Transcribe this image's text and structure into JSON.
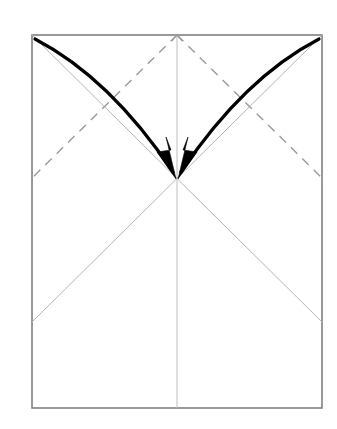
{
  "figure": {
    "type": "origami-instruction",
    "background_color": "#ffffff",
    "canvas": {
      "width": 337,
      "height": 429
    }
  },
  "paper": {
    "name": "paper-sheet",
    "shape": "rectangle",
    "left": 32,
    "top": 35,
    "right": 322,
    "bottom": 408,
    "width": 290,
    "height": 373,
    "fill_color": "#ffffff",
    "edge_color": "#808080",
    "edge_width": 1.6
  },
  "geometry": {
    "center_point": {
      "x": 177,
      "y": 178,
      "label": "convergence-point"
    },
    "top_center": {
      "x": 177,
      "y": 35
    },
    "bottom_center": {
      "x": 177,
      "y": 408
    },
    "top_left": {
      "x": 32,
      "y": 35
    },
    "top_right": {
      "x": 322,
      "y": 35
    },
    "bottom_left": {
      "x": 32,
      "y": 408
    },
    "bottom_right": {
      "x": 322,
      "y": 408
    },
    "left_mid": {
      "x": 32,
      "y": 178
    },
    "right_mid": {
      "x": 322,
      "y": 178
    },
    "left_lower": {
      "x": 32,
      "y": 322
    },
    "right_lower": {
      "x": 322,
      "y": 322
    }
  },
  "crease_lines": {
    "vertical_center": {
      "name": "vertical-center-crease",
      "style": "solid",
      "color": "#bdbdbd",
      "width": 1.0,
      "from": {
        "x": 177,
        "y": 35
      },
      "to": {
        "x": 177,
        "y": 408
      }
    },
    "diagonals": [
      {
        "name": "crease-top-left-to-right-lower",
        "style": "solid",
        "color": "#b5b5b5",
        "width": 1.0,
        "from": {
          "x": 32,
          "y": 35
        },
        "to": {
          "x": 322,
          "y": 322
        }
      },
      {
        "name": "crease-top-right-to-left-lower",
        "style": "solid",
        "color": "#b5b5b5",
        "width": 1.0,
        "from": {
          "x": 322,
          "y": 35
        },
        "to": {
          "x": 32,
          "y": 322
        }
      }
    ],
    "dashed": [
      {
        "name": "valley-fold-left",
        "style": "dashed",
        "color": "#9a9a9a",
        "width": 1.4,
        "dash_pattern": "9 7",
        "from": {
          "x": 177,
          "y": 35
        },
        "to": {
          "x": 32,
          "y": 178
        }
      },
      {
        "name": "valley-fold-right",
        "style": "dashed",
        "color": "#9a9a9a",
        "width": 1.4,
        "dash_pattern": "9 7",
        "from": {
          "x": 177,
          "y": 35
        },
        "to": {
          "x": 322,
          "y": 178
        }
      }
    ]
  },
  "arrows": [
    {
      "name": "fold-arrow-left",
      "color": "#000000",
      "stroke_width": 3.2,
      "start": {
        "x": 35,
        "y": 39
      },
      "control": {
        "x": 110,
        "y": 78
      },
      "end": {
        "x": 173,
        "y": 172
      },
      "direction": "top-left-corner-to-center",
      "head": "solid-triangle"
    },
    {
      "name": "fold-arrow-right",
      "color": "#000000",
      "stroke_width": 3.2,
      "start": {
        "x": 319,
        "y": 39
      },
      "control": {
        "x": 244,
        "y": 78
      },
      "end": {
        "x": 181,
        "y": 172
      },
      "direction": "top-right-corner-to-center",
      "head": "solid-triangle"
    }
  ]
}
